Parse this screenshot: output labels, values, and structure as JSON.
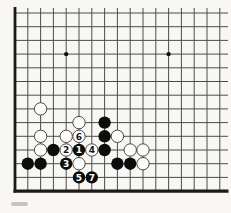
{
  "figure": {
    "kind": "go-board-diagram",
    "background_color": "#f8f7f4"
  },
  "board": {
    "visible_cols": 17,
    "visible_rows": 14,
    "origin_x": 15,
    "origin_y": 13,
    "col_spacing": 12.8,
    "row_spacing": 13.7,
    "grid_line_color": "#4d4d4d",
    "edge_line_color": "#1a1a1a",
    "thin_line_width": 1,
    "left_edge_width": 2.8,
    "bottom_edge_width": 3.2,
    "h_line_right_end_x": 228,
    "v_line_top_y": 8,
    "star_point_radius": 2.2,
    "star_point_color": "#111111",
    "star_points": [
      {
        "col": 5,
        "row": 4
      },
      {
        "col": 13,
        "row": 4
      }
    ]
  },
  "stones": {
    "radius": 6.2,
    "black_fill": "#0c0c0c",
    "white_fill": "#fdfdfc",
    "white_stroke": "#474747",
    "numeral_color_on_black": "#ffffff",
    "numeral_color_on_white": "#151515",
    "numeral_font_size": 9,
    "list": [
      {
        "col": 3,
        "row": 8,
        "color": "white",
        "label": ""
      },
      {
        "col": 6,
        "row": 9,
        "color": "white",
        "label": ""
      },
      {
        "col": 8,
        "row": 9,
        "color": "black",
        "label": ""
      },
      {
        "col": 3,
        "row": 10,
        "color": "white",
        "label": ""
      },
      {
        "col": 5,
        "row": 10,
        "color": "white",
        "label": ""
      },
      {
        "col": 6,
        "row": 10,
        "color": "white",
        "label": "6"
      },
      {
        "col": 8,
        "row": 10,
        "color": "black",
        "label": ""
      },
      {
        "col": 9,
        "row": 10,
        "color": "white",
        "label": ""
      },
      {
        "col": 3,
        "row": 11,
        "color": "white",
        "label": ""
      },
      {
        "col": 4,
        "row": 11,
        "color": "black",
        "label": ""
      },
      {
        "col": 5,
        "row": 11,
        "color": "white",
        "label": "2"
      },
      {
        "col": 6,
        "row": 11,
        "color": "black",
        "label": "1"
      },
      {
        "col": 7,
        "row": 11,
        "color": "white",
        "label": "4"
      },
      {
        "col": 8,
        "row": 11,
        "color": "black",
        "label": ""
      },
      {
        "col": 10,
        "row": 11,
        "color": "white",
        "label": ""
      },
      {
        "col": 11,
        "row": 11,
        "color": "white",
        "label": ""
      },
      {
        "col": 2,
        "row": 12,
        "color": "black",
        "label": ""
      },
      {
        "col": 3,
        "row": 12,
        "color": "black",
        "label": ""
      },
      {
        "col": 5,
        "row": 12,
        "color": "black",
        "label": "3"
      },
      {
        "col": 6,
        "row": 12,
        "color": "white",
        "label": ""
      },
      {
        "col": 9,
        "row": 12,
        "color": "black",
        "label": ""
      },
      {
        "col": 10,
        "row": 12,
        "color": "black",
        "label": ""
      },
      {
        "col": 11,
        "row": 12,
        "color": "white",
        "label": ""
      },
      {
        "col": 6,
        "row": 13,
        "color": "black",
        "label": "5"
      },
      {
        "col": 7,
        "row": 13,
        "color": "black",
        "label": "7"
      }
    ]
  },
  "artifacts": {
    "caption_fragment": {
      "x": 11,
      "y": 202,
      "width": 17,
      "height": 4,
      "color": "#c6c4bf"
    }
  }
}
